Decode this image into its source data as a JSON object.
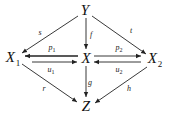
{
  "diagram": {
    "type": "commutative-diagram",
    "nodes": {
      "Y": {
        "label": "Y",
        "sub": "",
        "x": 85,
        "y": 10
      },
      "X1": {
        "label": "X",
        "sub": "1",
        "x": 14,
        "y": 58
      },
      "X": {
        "label": "X",
        "sub": "",
        "x": 86,
        "y": 58
      },
      "X2": {
        "label": "X",
        "sub": "2",
        "x": 155,
        "y": 60
      },
      "Z": {
        "label": "Z",
        "sub": "",
        "x": 86,
        "y": 105
      }
    },
    "edges": {
      "s": {
        "label": "s",
        "sub": "",
        "from": "Y",
        "to": "X1"
      },
      "f": {
        "label": "f",
        "sub": "",
        "from": "Y",
        "to": "X"
      },
      "t": {
        "label": "t",
        "sub": "",
        "from": "Y",
        "to": "X2"
      },
      "p1": {
        "label": "p",
        "sub": "1",
        "from": "X",
        "to": "X1"
      },
      "u1": {
        "label": "u",
        "sub": "1",
        "from": "X1",
        "to": "X"
      },
      "p2": {
        "label": "p",
        "sub": "2",
        "from": "X",
        "to": "X2"
      },
      "u2": {
        "label": "u",
        "sub": "2",
        "from": "X2",
        "to": "X"
      },
      "r": {
        "label": "r",
        "sub": "",
        "from": "X1",
        "to": "Z"
      },
      "g": {
        "label": "g",
        "sub": "",
        "from": "X",
        "to": "Z"
      },
      "h": {
        "label": "h",
        "sub": "",
        "from": "X2",
        "to": "Z"
      }
    },
    "colors": {
      "stroke": "#222222",
      "background": "#ffffff"
    }
  }
}
